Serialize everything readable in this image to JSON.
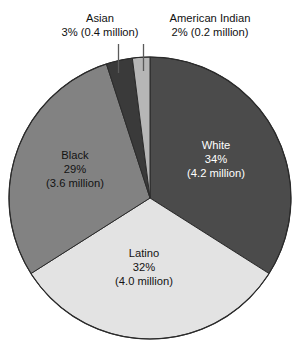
{
  "chart_data": {
    "type": "pie",
    "title": "",
    "subtitle": "",
    "xlabel": "",
    "ylabel": "",
    "legend_position": "none",
    "grid": false,
    "categories": [
      "White",
      "Latino",
      "Black",
      "Asian",
      "American Indian"
    ],
    "values": [
      34,
      32,
      29,
      3,
      2
    ],
    "value_unit": "percent",
    "counts_millions": [
      4.2,
      4.0,
      3.6,
      0.4,
      0.2
    ],
    "start_angle_deg": 0,
    "direction": "clockwise",
    "slices": [
      {
        "name": "White",
        "percent": 34,
        "count_millions": 4.2,
        "color": "#4b4b4b",
        "label_placement": "inside",
        "label_color": "#ffffff",
        "label_name": "White",
        "label_percent": "34%",
        "label_count": "(4.2 million)"
      },
      {
        "name": "Latino",
        "percent": 32,
        "count_millions": 4.0,
        "color": "#e3e3e3",
        "label_placement": "inside",
        "label_color": "#131313",
        "label_name": "Latino",
        "label_percent": "32%",
        "label_count": "(4.0 million)"
      },
      {
        "name": "Black",
        "percent": 29,
        "count_millions": 3.6,
        "color": "#828282",
        "label_placement": "inside",
        "label_color": "#131313",
        "label_name": "Black",
        "label_percent": "29%",
        "label_count": "(3.6 million)"
      },
      {
        "name": "Asian",
        "percent": 3,
        "count_millions": 0.4,
        "color": "#3a3a3a",
        "label_placement": "callout-top",
        "label_color": "#111111",
        "label_name": "Asian",
        "label_value": "3% (0.4 million)"
      },
      {
        "name": "American Indian",
        "percent": 2,
        "count_millions": 0.2,
        "color": "#b6b6b6",
        "label_placement": "callout-top",
        "label_color": "#111111",
        "label_name": "American Indian",
        "label_value": "2% (0.2 million)"
      }
    ]
  },
  "callouts": {
    "asian": {
      "name": "Asian",
      "value": "3% (0.4 million)"
    },
    "american_indian": {
      "name": "American Indian",
      "value": "2% (0.2 million)"
    }
  },
  "inside_labels": {
    "white": {
      "name": "White",
      "percent": "34%",
      "count": "(4.2 million)"
    },
    "black": {
      "name": "Black",
      "percent": "29%",
      "count": "(3.6 million)"
    },
    "latino": {
      "name": "Latino",
      "percent": "32%",
      "count": "(4.0 million)"
    }
  },
  "colors": {
    "white_slice": "#4b4b4b",
    "latino_slice": "#e3e3e3",
    "black_slice": "#828282",
    "asian_slice": "#3a3a3a",
    "american_indian_slice": "#b6b6b6",
    "outline": "#2b2b2b",
    "leader_line": "#5a5a5a",
    "background": "#ffffff"
  }
}
